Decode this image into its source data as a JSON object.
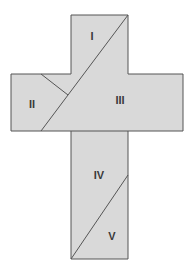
{
  "diagram": {
    "type": "dissection-cross",
    "fill": "#d9d9d9",
    "stroke": "#555555",
    "pieces": [
      {
        "id": "I",
        "label": "I"
      },
      {
        "id": "II",
        "label": "II"
      },
      {
        "id": "III",
        "label": "III"
      },
      {
        "id": "IV",
        "label": "IV"
      },
      {
        "id": "V",
        "label": "V"
      }
    ]
  }
}
